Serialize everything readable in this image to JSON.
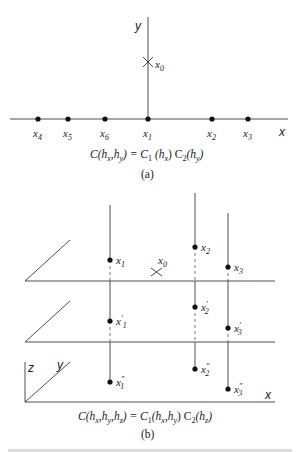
{
  "panel_a": {
    "axis_labels": {
      "x": "x",
      "y": "y"
    },
    "origin_point": {
      "label": "x",
      "sub": "0"
    },
    "points": [
      {
        "label": "x",
        "sub": "4"
      },
      {
        "label": "x",
        "sub": "5"
      },
      {
        "label": "x",
        "sub": "6"
      },
      {
        "label": "x",
        "sub": "1"
      },
      {
        "label": "x",
        "sub": "2"
      },
      {
        "label": "x",
        "sub": "3"
      }
    ],
    "formula": "C(hx,hy) = C1 (hx) C2(hy)",
    "formula_parts": {
      "lhs": "C(h",
      "lhs_s1": "x",
      "lhs_m": ",h",
      "lhs_s2": "y",
      "lhs_e": ") = C",
      "c1_sub": "1",
      "mid": " (h",
      "mid_s": "x",
      "mid_e": ") C",
      "c2_sub": "2",
      "end": "(h",
      "end_s": "y",
      "end_e": ")"
    },
    "caption": "(a)"
  },
  "panel_b": {
    "axis_labels": {
      "x": "x",
      "y": "y",
      "z": "z"
    },
    "origin_point": {
      "label": "x",
      "sub": "0"
    },
    "plane1_points": [
      {
        "label": "x",
        "sub": "1"
      },
      {
        "label": "x",
        "sub": "2"
      },
      {
        "label": "x",
        "sub": "3"
      }
    ],
    "plane2_points": [
      {
        "label": "x",
        "sup": "′",
        "sub": "1"
      },
      {
        "label": "x",
        "sup": "′",
        "sub": "2"
      },
      {
        "label": "x",
        "sup": "′",
        "sub": "3"
      }
    ],
    "plane3_points": [
      {
        "label": "x",
        "sup": "″",
        "sub": "1"
      },
      {
        "label": "x",
        "sup": "″",
        "sub": "2"
      },
      {
        "label": "x",
        "sup": "″",
        "sub": "3"
      }
    ],
    "formula": "C(hx,hy,hz) = C1(hx,hy) C2(hz)",
    "formula_parts": {
      "lhs": "C(h",
      "s1": "x",
      "m1": ",h",
      "s2": "y",
      "m2": ",h",
      "s3": "z",
      "eq": ") = C",
      "c1_sub": "1",
      "m3": "(h",
      "s4": "x",
      "m4": ",h",
      "s5": "y",
      "m5": ") C",
      "c2_sub": "2",
      "m6": "(h",
      "s6": "z",
      "end": ")"
    },
    "caption": "(b)"
  }
}
